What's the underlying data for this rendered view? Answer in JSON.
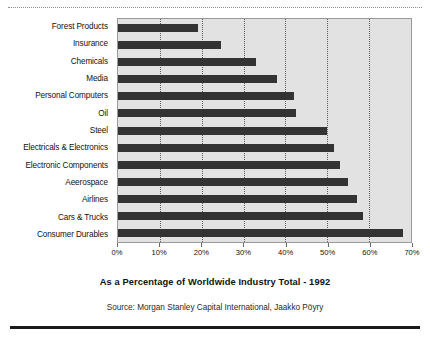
{
  "chart_data": {
    "type": "bar",
    "orientation": "horizontal",
    "title": "",
    "xlabel": "As a Percentage of Worldwide Industry Total - 1992",
    "ylabel": "",
    "xlim": [
      0,
      70
    ],
    "xticks": [
      "0%",
      "10%",
      "20%",
      "30%",
      "40%",
      "50%",
      "60%",
      "70%"
    ],
    "xtick_values": [
      0,
      10,
      20,
      30,
      40,
      50,
      60,
      70
    ],
    "grid": true,
    "legend": "none",
    "categories": [
      "Forest Products",
      "Insurance",
      "Chemicals",
      "Media",
      "Personal Computers",
      "Oil",
      "Steel",
      "Electricals & Electronics",
      "Electronic Components",
      "Aeerospace",
      "Airlines",
      "Cars & Trucks",
      "Consumer Durables"
    ],
    "values": [
      19,
      24.5,
      33,
      38,
      42,
      42.5,
      50,
      51.5,
      53,
      55,
      57,
      58.5,
      68
    ],
    "bar_color": "#333333",
    "plot_background": "#e2e2e2"
  },
  "footer": {
    "source": "Source: Morgan Stanley Capital International, Jaakko Pöyry"
  }
}
